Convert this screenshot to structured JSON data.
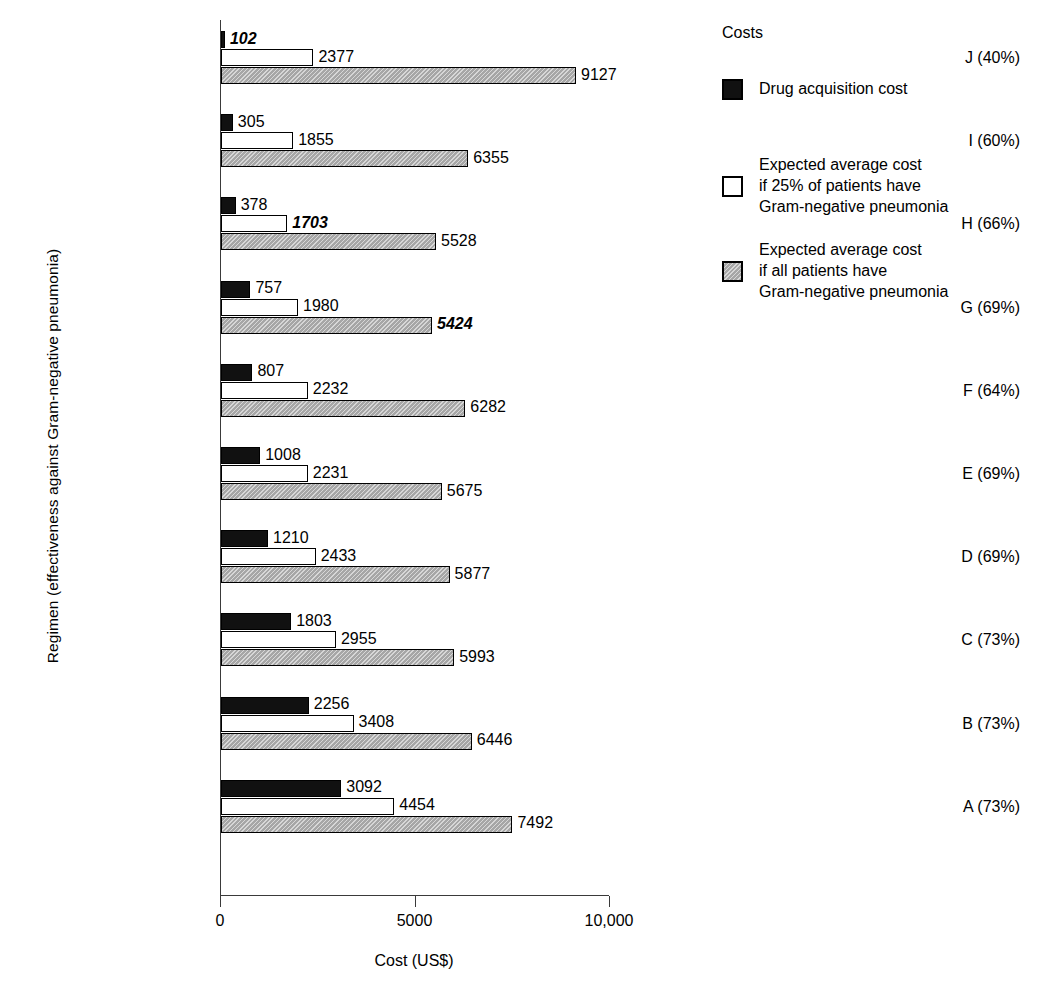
{
  "chart_data": {
    "type": "bar",
    "orientation": "horizontal",
    "title": "",
    "xlabel": "Cost (US$)",
    "ylabel": "Regimen (effectiveness against Gram-negative pneumonia)",
    "xlim": [
      0,
      10000
    ],
    "xticks": [
      0,
      5000,
      10000
    ],
    "xticklabels": [
      "0",
      "5000",
      "10,000"
    ],
    "grid": false,
    "legend_position": "right",
    "legend_title": "Costs",
    "categories": [
      "J (40%)",
      "I (60%)",
      "H (66%)",
      "G (69%)",
      "F (64%)",
      "E (69%)",
      "D (69%)",
      "C (73%)",
      "B (73%)",
      "A (73%)"
    ],
    "series": [
      {
        "name": "Drug acquisition cost",
        "swatch": "black",
        "values": [
          102,
          305,
          378,
          757,
          807,
          1008,
          1210,
          1803,
          2256,
          3092
        ],
        "emphasized": [
          true,
          false,
          false,
          false,
          false,
          false,
          false,
          false,
          false,
          false
        ]
      },
      {
        "name": "Expected average cost if 25% of patients have Gram-negative pneumonia",
        "swatch": "white",
        "values": [
          2377,
          1855,
          1703,
          1980,
          2232,
          2231,
          2433,
          2955,
          3408,
          4454
        ],
        "emphasized": [
          false,
          false,
          true,
          false,
          false,
          false,
          false,
          false,
          false,
          false
        ]
      },
      {
        "name": "Expected average cost if all patients have Gram-negative pneumonia",
        "swatch": "gray",
        "values": [
          9127,
          6355,
          5528,
          5424,
          6282,
          5675,
          5877,
          5993,
          6446,
          7492
        ],
        "emphasized": [
          false,
          false,
          false,
          true,
          false,
          false,
          false,
          false,
          false,
          false
        ]
      }
    ]
  },
  "legend": {
    "title": "Costs",
    "items": [
      {
        "swatch": "black",
        "lines": [
          "Drug acquisition cost"
        ]
      },
      {
        "swatch": "white",
        "lines": [
          "Expected average cost",
          "if 25% of patients have",
          "Gram-negative pneumonia"
        ]
      },
      {
        "swatch": "gray",
        "lines": [
          "Expected average cost",
          "if all patients have",
          "Gram-negative pneumonia"
        ]
      }
    ]
  },
  "axes": {
    "x_title": "Cost (US$)",
    "y_title": "Regimen (effectiveness against Gram-negative pneumonia)",
    "x_tick_labels": [
      "0",
      "5000",
      "10,000"
    ]
  },
  "colors": {
    "series_black": "#111111",
    "series_white": "#ffffff",
    "series_gray": "#a6a6a6",
    "axis": "#3a3a3a",
    "text": "#000000",
    "background": "#ffffff"
  }
}
